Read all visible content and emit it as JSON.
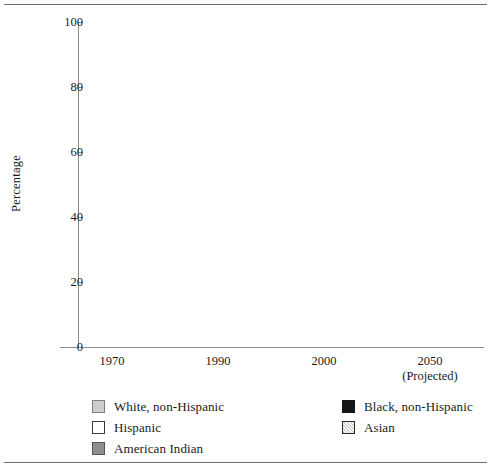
{
  "chart_data": {
    "type": "bar",
    "subtype": "stacked-bar",
    "title": "",
    "xlabel": "",
    "ylabel": "Percentage",
    "ylim": [
      0,
      100
    ],
    "yticks": [
      0,
      20,
      40,
      60,
      80,
      100
    ],
    "ytick_labels": [
      "0",
      "20",
      "40",
      "60",
      "80",
      "100"
    ],
    "grid": false,
    "legend_position": "bottom",
    "categories": [
      "1970",
      "1990",
      "2000",
      "2050"
    ],
    "category_sublabels": [
      "",
      "",
      "",
      "(Projected)"
    ],
    "series": [
      {
        "name": "White, non-Hispanic",
        "key": "white-nh",
        "swatch": "light-gray-fill",
        "values": [
          83,
          75,
          70,
          51
        ]
      },
      {
        "name": "Black, non-Hispanic",
        "key": "black-nh",
        "swatch": "black-fill",
        "values": [
          10,
          12,
          13,
          17
        ]
      },
      {
        "name": "Hispanic",
        "key": "hispanic",
        "swatch": "white-fill",
        "values": [
          4.5,
          9,
          12,
          23
        ]
      },
      {
        "name": "Asian",
        "key": "asian",
        "swatch": "diagonal-hatch",
        "values": [
          1.5,
          3,
          4,
          8
        ]
      },
      {
        "name": "American Indian",
        "key": "amindian",
        "swatch": "dark-gray-fill",
        "values": [
          1,
          1,
          1,
          1
        ]
      }
    ],
    "colors": {
      "white-nh": "#cdcdcd",
      "black-nh": "#151515",
      "hispanic": "#ffffff",
      "asian": "#ffffff",
      "amindian": "#8e8e8e",
      "outline": "#8d8d8d",
      "axis": "#8c8c8c",
      "rule": "#6f6f6f",
      "text": "#1a1a1a"
    }
  },
  "legend": {
    "columns": [
      {
        "items": [
          {
            "label": "White, non-Hispanic",
            "key": "white-nh"
          },
          {
            "label": "Hispanic",
            "key": "hispanic"
          },
          {
            "label": "American Indian",
            "key": "amindian"
          }
        ]
      },
      {
        "items": [
          {
            "label": "Black, non-Hispanic",
            "key": "black-nh"
          },
          {
            "label": "Asian",
            "key": "asian"
          }
        ]
      }
    ]
  }
}
